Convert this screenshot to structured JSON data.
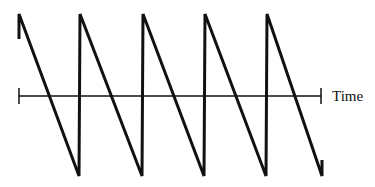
{
  "diagram": {
    "type": "sawtooth-waveform",
    "axis_label": "Time",
    "stroke_color": "#111111",
    "background": "#ffffff",
    "axis": {
      "y": 96,
      "x_start": 19,
      "x_end": 321
    },
    "waveform_points": [
      [
        19,
        39
      ],
      [
        19,
        14
      ],
      [
        79,
        176
      ],
      [
        80,
        14
      ],
      [
        142,
        176
      ],
      [
        143,
        14
      ],
      [
        204,
        176
      ],
      [
        205,
        14
      ],
      [
        266,
        176
      ],
      [
        267,
        14
      ],
      [
        322,
        176
      ],
      [
        322,
        160
      ]
    ],
    "cycles": 5
  }
}
